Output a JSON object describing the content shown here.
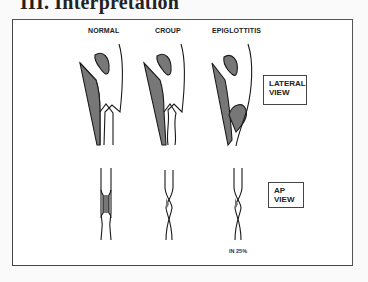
{
  "heading": "III. Interpretation",
  "columns": [
    {
      "label": "NORMAL"
    },
    {
      "label": "CROUP"
    },
    {
      "label": "EPIGLOTTITIS"
    }
  ],
  "views": {
    "lateral": {
      "line1": "LATERAL",
      "line2": "VIEW"
    },
    "ap": {
      "line1": "AP",
      "line2": "VIEW"
    }
  },
  "notes": {
    "epiglottitis_ap": "IN 25%"
  },
  "colors": {
    "fill": "#777777",
    "stroke": "#1a1a1a"
  }
}
